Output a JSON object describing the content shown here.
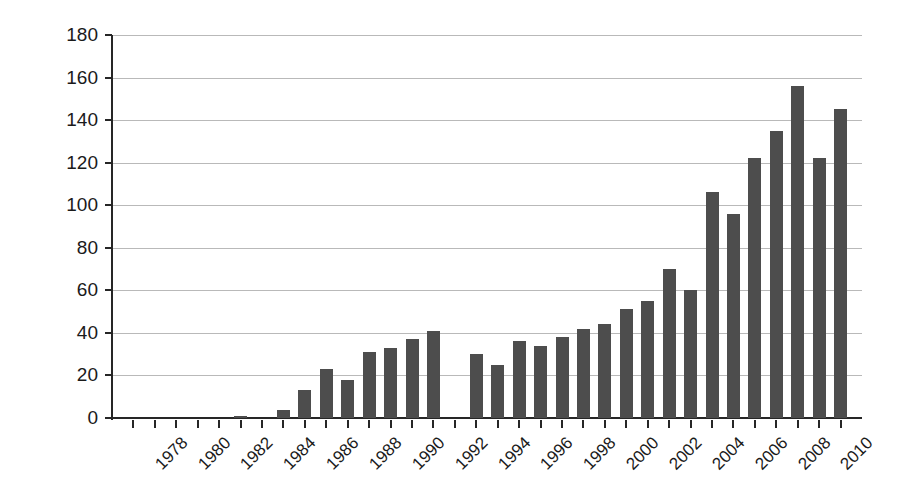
{
  "chart_data": {
    "type": "bar",
    "title": "",
    "xlabel": "",
    "ylabel": "Number of scientific articles",
    "ylim": [
      0,
      180
    ],
    "ytick_values": [
      0,
      20,
      40,
      60,
      80,
      100,
      120,
      140,
      160,
      180
    ],
    "ytick_labels": [
      "0",
      "20",
      "40",
      "60",
      "80",
      "100",
      "120",
      "140",
      "160",
      "180"
    ],
    "grid": "horizontal",
    "legend": "none",
    "bar_color": "#4d4d4d",
    "categories": [
      "1978",
      "1979",
      "1980",
      "1981",
      "1982",
      "1983",
      "1984",
      "1985",
      "1986",
      "1987",
      "1988",
      "1989",
      "1990",
      "1991",
      "1992",
      "1993",
      "1994",
      "1995",
      "1996",
      "1997",
      "1998",
      "1999",
      "2000",
      "2001",
      "2002",
      "2003",
      "2004",
      "2005",
      "2006",
      "2007",
      "2008",
      "2009",
      "2010",
      "2011"
    ],
    "values": [
      0,
      0,
      0,
      0,
      0,
      1,
      0,
      4,
      13,
      23,
      18,
      31,
      33,
      37,
      41,
      0,
      30,
      25,
      36,
      34,
      38,
      42,
      44,
      51,
      55,
      70,
      60,
      106,
      96,
      122,
      135,
      156,
      122,
      145
    ],
    "xtick_labels": [
      "1978",
      "1980",
      "1982",
      "1984",
      "1986",
      "1988",
      "1990",
      "1992",
      "1994",
      "1996",
      "1998",
      "2000",
      "2002",
      "2004",
      "2006",
      "2008",
      "2010"
    ]
  }
}
